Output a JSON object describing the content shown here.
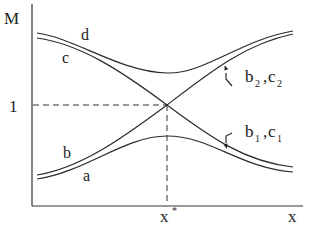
{
  "diagram": {
    "y_axis_label": "M",
    "x_axis_label": "x",
    "y_tick_label": "1",
    "x_tick_label": "x",
    "x_tick_superscript": "*",
    "curve_labels": {
      "a": "a",
      "b": "b",
      "c": "c",
      "d": "d"
    },
    "annotation_upper": {
      "b": "b",
      "b_sub": "2",
      "sep": ",",
      "c": "c",
      "c_sub": "2"
    },
    "annotation_lower": {
      "b": "b",
      "b_sub": "1",
      "sep": ",",
      "c": "c",
      "c_sub": "1"
    }
  }
}
